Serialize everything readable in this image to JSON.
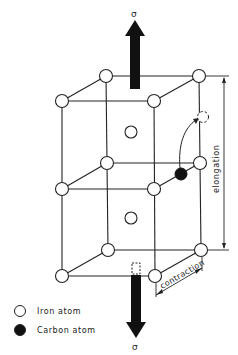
{
  "figure": {
    "type": "bcc-crystal-lattice-martensite-strain",
    "stress_symbol_top": "σ",
    "stress_symbol_bottom": "σ",
    "labels": {
      "elongation": "elongation",
      "contraction": "contraction"
    },
    "legend": [
      {
        "key": "iron",
        "label": "Iron atom",
        "fill": "#ffffff"
      },
      {
        "key": "carbon",
        "label": "Carbon atom",
        "fill": "#111111"
      }
    ],
    "colors": {
      "line": "#222222",
      "arrow": "#111111",
      "background": "#ffffff"
    }
  }
}
